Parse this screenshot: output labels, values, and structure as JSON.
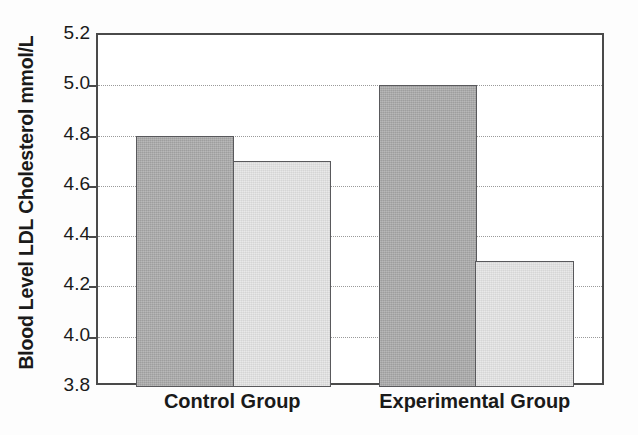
{
  "chart_data": {
    "type": "bar",
    "title": "",
    "subtitle": "",
    "xlabel": "",
    "ylabel": "Blood Level LDL Cholesterol mmol/L",
    "categories": [
      "Control Group",
      "Experimental Group"
    ],
    "series": [
      {
        "name": "series-1",
        "color": "#a9a9a9",
        "values": [
          4.8,
          5.0
        ]
      },
      {
        "name": "series-2",
        "color": "#e4e4e4",
        "values": [
          4.7,
          4.3
        ]
      }
    ],
    "ylim": [
      3.8,
      5.2
    ],
    "ytick_step": 0.2,
    "ytick_labels": [
      "3.8",
      "4.0",
      "4.2",
      "4.4",
      "4.6",
      "4.8",
      "5.0",
      "5.2"
    ],
    "ytick_values": [
      3.8,
      4.0,
      4.2,
      4.4,
      4.6,
      4.8,
      5.0,
      5.2
    ],
    "grid": "horizontal-dotted",
    "grid_color": "#9a9a9a",
    "legend": "none",
    "legend_position": "none",
    "axis_color": "#4a4a4a",
    "bar_edge_color": "#59595c",
    "background_color": "#ffffff",
    "text_color": "#1a1a1a",
    "annotations": []
  }
}
